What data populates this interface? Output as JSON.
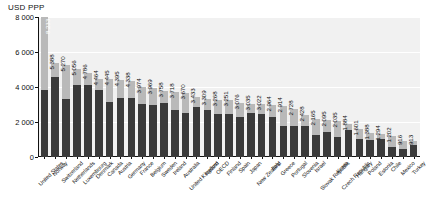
{
  "axis": {
    "unit_label": "USD PPP",
    "y_ticks": [
      "8 000",
      "6 000",
      "4 000",
      "2 000",
      "0"
    ]
  },
  "legend": {
    "public_label": "Public expenditure on health",
    "private_label": "Private expenditure on health"
  },
  "chart_data": {
    "type": "bar",
    "title": "",
    "subtitle": "",
    "xlabel": "",
    "ylabel": "USD PPP",
    "ylim": [
      0,
      8000
    ],
    "y_ticks": [
      0,
      2000,
      4000,
      6000,
      8000
    ],
    "grid": true,
    "stacked": true,
    "legend_position": "top-center",
    "colors": {
      "public": "#3a3a3a",
      "private": "#b9b9b9",
      "plot_background": "#f1f1f1"
    },
    "categories": [
      "United States",
      "Norway",
      "Switzerland",
      "Netherlands",
      "Luxembourg",
      "Denmark",
      "Canada",
      "Austria",
      "Germany",
      "France",
      "Belgium",
      "Sweden",
      "Ireland",
      "Australia",
      "United Kingdom",
      "Iceland",
      "OECD",
      "Finland",
      "Spain",
      "Japan",
      "New Zealand",
      "Italy",
      "Greece",
      "Portugal",
      "Slovenia",
      "Israel",
      "Slovak Republic",
      "Korea",
      "Czech Republic",
      "Hungary",
      "Poland",
      "Estonia",
      "Chile",
      "Mexico",
      "Turkey"
    ],
    "totals": [
      8233,
      5388,
      5270,
      5056,
      4786,
      4464,
      4445,
      4395,
      4338,
      3974,
      3969,
      3758,
      3718,
      3670,
      3433,
      3309,
      3268,
      3251,
      3076,
      3035,
      3022,
      2964,
      2914,
      2728,
      2428,
      2165,
      2095,
      2035,
      1884,
      1601,
      1388,
      1294,
      1202,
      916,
      913
    ],
    "series": [
      {
        "name": "Public expenditure on health",
        "values": [
          3967,
          4576,
          3311,
          4109,
          4104,
          3812,
          3156,
          3395,
          3362,
          3051,
          2976,
          3081,
          2688,
          2496,
          2835,
          2707,
          2445,
          2479,
          2262,
          2519,
          2449,
          2305,
          1755,
          1744,
          1775,
          1272,
          1425,
          1162,
          1571,
          1054,
          991,
          1004,
          563,
          430,
          690
        ]
      },
      {
        "name": "Private expenditure on health",
        "values": [
          4266,
          812,
          1959,
          947,
          682,
          652,
          1289,
          1000,
          976,
          923,
          993,
          677,
          1030,
          1174,
          598,
          602,
          823,
          772,
          814,
          516,
          573,
          659,
          1159,
          984,
          653,
          893,
          670,
          873,
          313,
          547,
          397,
          290,
          639,
          486,
          223
        ]
      }
    ],
    "value_labels": [
      "8 233",
      "5 388",
      "5 270",
      "5 056",
      "4 786",
      "4 464",
      "4 445",
      "4 395",
      "4 338",
      "3 974",
      "3 969",
      "3 758",
      "3 718",
      "3 670",
      "3 433",
      "3 309",
      "3 268",
      "3 251",
      "3 076",
      "3 035",
      "3 022",
      "2 964",
      "2 914",
      "2 728",
      "2 428",
      "2 165",
      "2 095",
      "2 035",
      "1 884",
      "1 601",
      "1 388",
      "1 294",
      "1 202",
      "916",
      "913"
    ]
  }
}
